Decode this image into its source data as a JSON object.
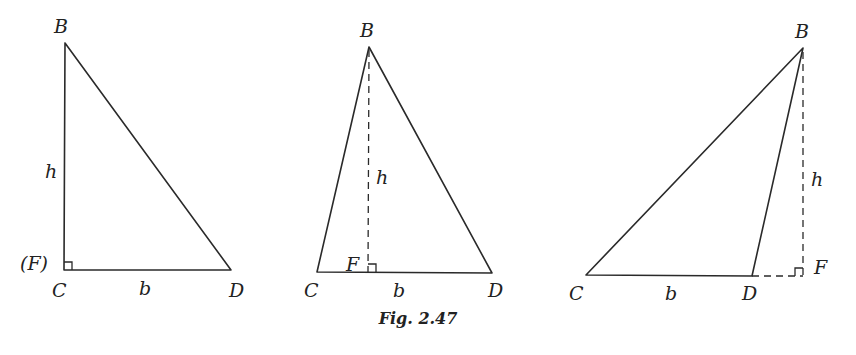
{
  "caption": "Fig. 2.47",
  "figures": [
    {
      "id": "right-triangle",
      "labels": {
        "B": "B",
        "C": "C",
        "D": "D",
        "F": "(F)",
        "h": "h",
        "b": "b"
      },
      "points": {
        "B": [
          65,
          43
        ],
        "C": [
          64,
          270
        ],
        "D": [
          231,
          270
        ],
        "F": [
          64,
          270
        ]
      }
    },
    {
      "id": "acute-triangle",
      "labels": {
        "B": "B",
        "C": "C",
        "D": "D",
        "F": "F",
        "h": "h",
        "b": "b"
      },
      "points": {
        "B": [
          369,
          47
        ],
        "C": [
          317,
          272
        ],
        "D": [
          492,
          273
        ],
        "F": [
          368,
          272
        ]
      }
    },
    {
      "id": "obtuse-triangle",
      "labels": {
        "B": "B",
        "C": "C",
        "D": "D",
        "F": "F",
        "h": "h",
        "b": "b"
      },
      "points": {
        "B": [
          803,
          48
        ],
        "C": [
          586,
          275
        ],
        "D": [
          752,
          276
        ],
        "F": [
          803,
          276
        ]
      }
    }
  ]
}
